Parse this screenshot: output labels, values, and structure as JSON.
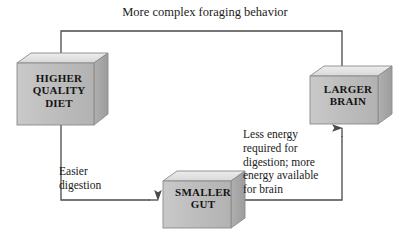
{
  "diagram": {
    "title": "More complex foraging behavior",
    "type": "cyclic-flow-diagram",
    "background_color": "#ffffff",
    "line_color": "#4a4a4a",
    "box_front_color": "#bdbdbd",
    "box_top_color": "#e2e2e2",
    "box_side_color": "#a6a6a6",
    "box_edge_color": "#8a8a8a",
    "text_color": "#141414"
  },
  "nodes": [
    {
      "id": "higher-quality-diet",
      "lines": [
        "HIGHER",
        "QUALITY",
        "DIET"
      ],
      "line1": "HIGHER",
      "line2": "QUALITY",
      "line3": "DIET"
    },
    {
      "id": "larger-brain",
      "lines": [
        "LARGER",
        "BRAIN"
      ],
      "line1": "LARGER",
      "line2": "BRAIN"
    },
    {
      "id": "smaller-gut",
      "lines": [
        "SMALLER",
        "GUT"
      ],
      "line1": "SMALLER",
      "line2": "GUT"
    }
  ],
  "edges": [
    {
      "id": "brain-to-diet",
      "from": "larger-brain",
      "to": "higher-quality-diet",
      "label": "More complex foraging behavior",
      "label_lines": [
        "More complex foraging behavior"
      ]
    },
    {
      "id": "diet-to-gut",
      "from": "higher-quality-diet",
      "to": "smaller-gut",
      "label": "Easier digestion",
      "label_lines": [
        "Easier",
        "digestion"
      ],
      "line1": "Easier",
      "line2": "digestion"
    },
    {
      "id": "gut-to-brain",
      "from": "smaller-gut",
      "to": "larger-brain",
      "label": "Less energy required for digestion; more energy available for brain",
      "label_lines": [
        "Less energy",
        "required for",
        "digestion; more",
        "energy available",
        "for brain"
      ],
      "line1": "Less energy",
      "line2": "required for",
      "line3": "digestion; more",
      "line4": "energy available",
      "line5": "for brain"
    }
  ]
}
